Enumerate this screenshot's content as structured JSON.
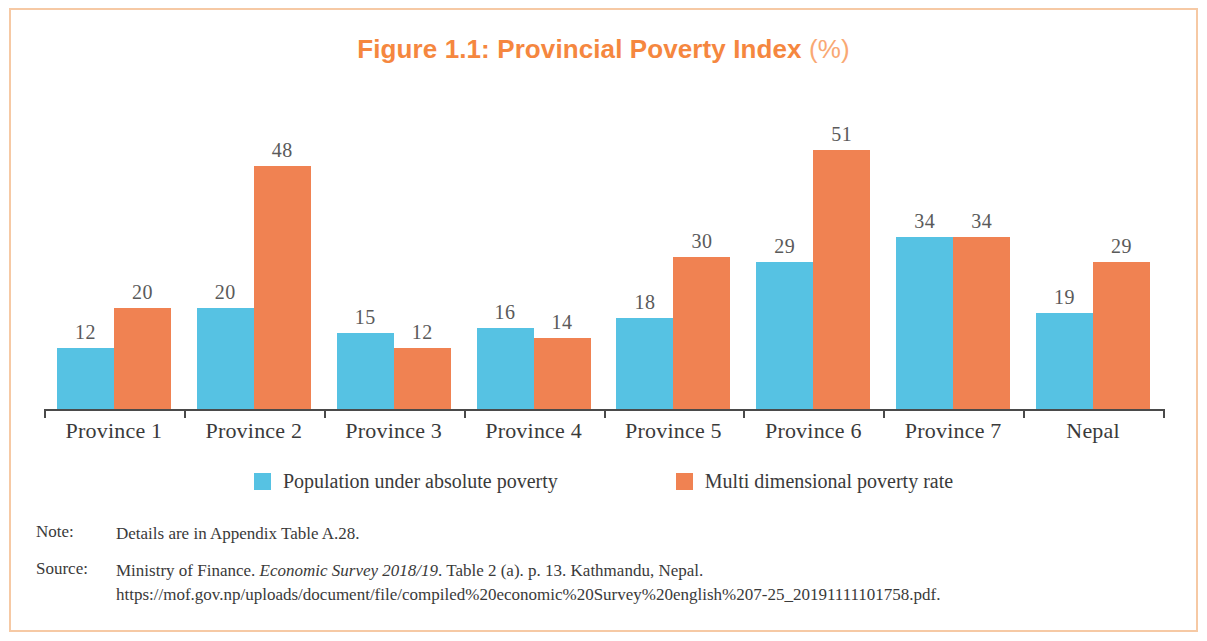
{
  "title": {
    "main": "Figure 1.1: Provincial Poverty Index",
    "unit": "(%)"
  },
  "colors": {
    "series_blue": "#56c2e3",
    "series_orange": "#f08252",
    "title_orange": "#f5873f",
    "frame": "#f6c9a4"
  },
  "legend": {
    "items": [
      {
        "label": "Population under absolute poverty",
        "color": "#56c2e3",
        "swatch": "blue-square-icon"
      },
      {
        "label": "Multi dimensional poverty rate",
        "color": "#f08252",
        "swatch": "orange-square-icon"
      }
    ]
  },
  "notes": {
    "note_key": "Note:",
    "note_text": "Details are in Appendix Table A.28.",
    "source_key": "Source:",
    "source_prefix": "Ministry of Finance. ",
    "source_italic": "Economic Survey 2018/19",
    "source_suffix": ". Table 2 (a). p. 13. Kathmandu, Nepal.",
    "source_url": "https://mof.gov.np/uploads/document/file/compiled%20economic%20Survey%20english%207-25_20191111101758.pdf."
  },
  "chart_data": {
    "type": "bar",
    "title": "Figure 1.1: Provincial Poverty Index (%)",
    "xlabel": "",
    "ylabel": "",
    "ylim": [
      0,
      55
    ],
    "grid": false,
    "legend_position": "bottom",
    "categories": [
      "Province 1",
      "Province 2",
      "Province 3",
      "Province 4",
      "Province 5",
      "Province 6",
      "Province 7",
      "Nepal"
    ],
    "series": [
      {
        "name": "Population under absolute poverty",
        "color": "#56c2e3",
        "values": [
          12,
          20,
          15,
          16,
          18,
          29,
          34,
          19
        ]
      },
      {
        "name": "Multi dimensional poverty rate",
        "color": "#f08252",
        "values": [
          20,
          48,
          12,
          14,
          30,
          51,
          34,
          29
        ]
      }
    ]
  }
}
